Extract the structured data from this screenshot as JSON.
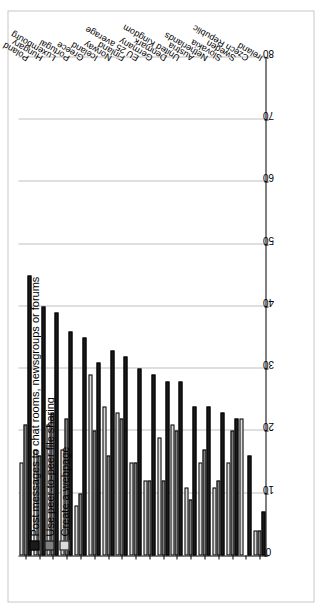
{
  "chart_data": {
    "type": "bar",
    "orientation": "horizontal",
    "title": "",
    "xlabel": "",
    "ylabel": "",
    "xlim": [
      0,
      80
    ],
    "ticks": [
      0,
      10,
      20,
      30,
      40,
      50,
      60,
      70,
      80
    ],
    "grid": true,
    "legend_position": "top-left",
    "categories": [
      "Ireland",
      "Czech Republic",
      "Sweden",
      "Slovakia",
      "Netherlands",
      "Austria",
      "United Kingdom",
      "Denmark",
      "Germany",
      "EU 25 average",
      "Finland",
      "Norway",
      "Iceland",
      "Greece",
      "Portugal",
      "Luxembourg",
      "Hungary",
      "Poland"
    ],
    "series": [
      {
        "name": "Post messages to chat rooms, newsgroups or forums",
        "color": "#1a1a1a",
        "values": [
          7,
          16,
          22,
          23,
          24,
          24,
          28,
          28,
          29,
          30,
          32,
          33,
          31,
          35,
          36,
          39,
          40,
          45
        ]
      },
      {
        "name": "Use peer-to-peer file sharing",
        "color": "#808080",
        "values": [
          4,
          0,
          20,
          12,
          17,
          9,
          20,
          12,
          12,
          15,
          22,
          16,
          20,
          10,
          22,
          23,
          16,
          21
        ]
      },
      {
        "name": "Create a webpage",
        "color": "#dcdcdc",
        "values": [
          4,
          22,
          15,
          11,
          15,
          11,
          21,
          19,
          12,
          15,
          23,
          24,
          29,
          8,
          17,
          21,
          17,
          15
        ]
      }
    ]
  },
  "legend": {
    "items": [
      "Post messages to chat rooms, newsgroups or forums",
      "Use peer-to-peer file sharing",
      "Create a webpage"
    ]
  }
}
